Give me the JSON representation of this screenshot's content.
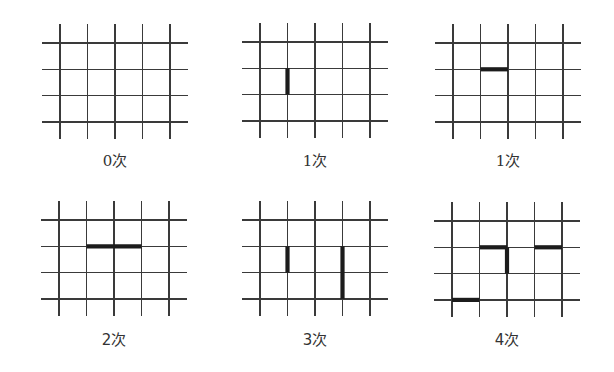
{
  "figure": {
    "grid": {
      "vertical_lines": 5,
      "horizontal_lines": 4
    },
    "panels": [
      {
        "label_number": "0",
        "label_unit": "次",
        "digit_style": "serif",
        "bold_segments": []
      },
      {
        "label_number": "1",
        "label_unit": "次",
        "digit_style": "serif",
        "bold_segments": [
          {
            "orientation": "vertical",
            "line": 2,
            "from": 2,
            "to": 3
          }
        ]
      },
      {
        "label_number": "1",
        "label_unit": "次",
        "digit_style": "serif",
        "bold_segments": [
          {
            "orientation": "horizontal",
            "line": 2,
            "from": 2,
            "to": 3
          }
        ]
      },
      {
        "label_number": "2",
        "label_unit": "次",
        "digit_style": "sans",
        "bold_segments": [
          {
            "orientation": "horizontal",
            "line": 2,
            "from": 2,
            "to": 4
          }
        ]
      },
      {
        "label_number": "3",
        "label_unit": "次",
        "digit_style": "sans",
        "bold_segments": [
          {
            "orientation": "vertical",
            "line": 2,
            "from": 2,
            "to": 3
          },
          {
            "orientation": "vertical",
            "line": 4,
            "from": 2,
            "to": 4
          }
        ]
      },
      {
        "label_number": "4",
        "label_unit": "次",
        "digit_style": "sans",
        "bold_segments": [
          {
            "orientation": "horizontal",
            "line": 2,
            "from": 2,
            "to": 3
          },
          {
            "orientation": "vertical",
            "line": 3,
            "from": 2,
            "to": 3
          },
          {
            "orientation": "horizontal",
            "line": 2,
            "from": 4,
            "to": 5
          },
          {
            "orientation": "horizontal",
            "line": 4,
            "from": 1,
            "to": 2
          }
        ]
      }
    ]
  }
}
